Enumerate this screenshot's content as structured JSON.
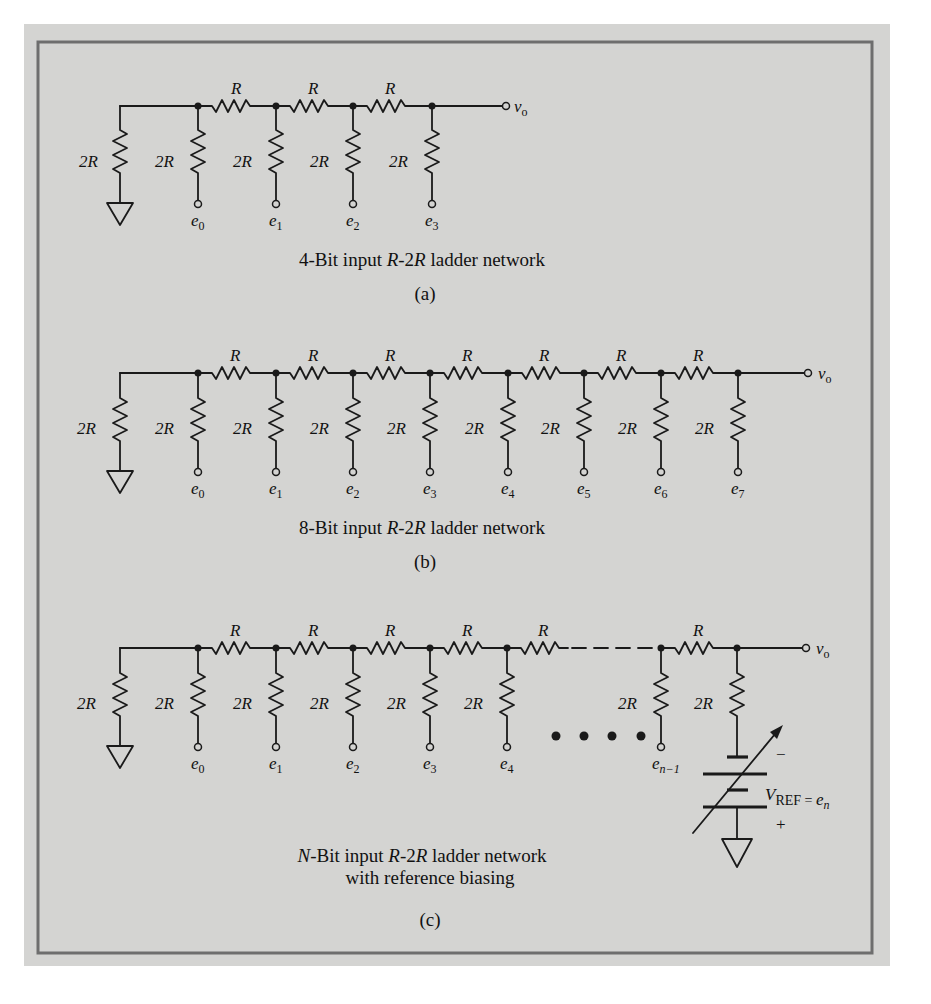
{
  "colors": {
    "background": "#d4d4d2",
    "frame": "#6e6e6e",
    "ink": "#1a1a1a"
  },
  "labels": {
    "series_resistor": "R",
    "shunt_resistor": "2R",
    "output": "v",
    "output_sub": "o",
    "input_prefix": "e"
  },
  "panels": [
    {
      "id": "a",
      "bits": 4,
      "inputs": [
        "0",
        "1",
        "2",
        "3"
      ],
      "caption_pre": "4-Bit input ",
      "caption_it": "R",
      "caption_mid": "-2",
      "caption_it2": "R",
      "caption_post": " ladder network",
      "tag": "(a)"
    },
    {
      "id": "b",
      "bits": 8,
      "inputs": [
        "0",
        "1",
        "2",
        "3",
        "4",
        "5",
        "6",
        "7"
      ],
      "caption_pre": "8-Bit input ",
      "caption_it": "R",
      "caption_mid": "-2",
      "caption_it2": "R",
      "caption_post": " ladder network",
      "tag": "(b)"
    },
    {
      "id": "c",
      "bits": "N",
      "inputs": [
        "0",
        "1",
        "2",
        "3",
        "4",
        "n−1"
      ],
      "caption_pre_it": "N",
      "caption_pre": "-Bit input  ",
      "caption_it": "R",
      "caption_mid": "-2",
      "caption_it2": "R",
      "caption_post": " ladder network",
      "caption_line2": "with reference biasing",
      "tag": "(c)",
      "reference": {
        "symbol": "V",
        "sub": "REF",
        "equals": " = ",
        "en": "e",
        "en_sub": "n",
        "minus": "−",
        "plus": "+"
      }
    }
  ]
}
